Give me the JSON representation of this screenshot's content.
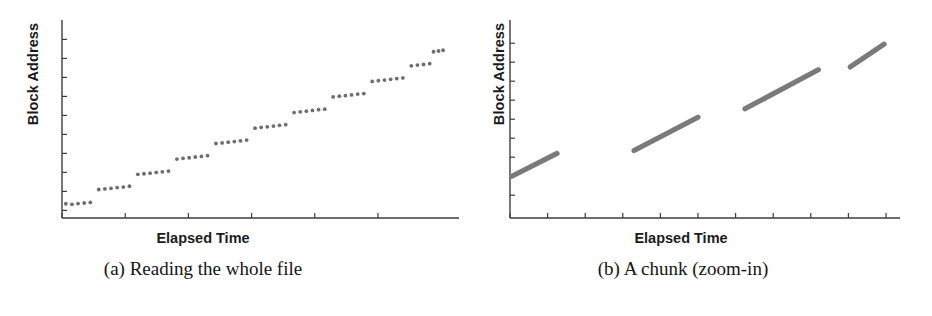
{
  "figure": {
    "panels": [
      {
        "id": "a",
        "ylabel": "Block Address",
        "xlabel": "Elapsed Time",
        "caption": "(a) Reading the whole file"
      },
      {
        "id": "b",
        "ylabel": "Block Address",
        "xlabel": "Elapsed Time",
        "caption": "(b) A chunk (zoom-in)"
      }
    ]
  },
  "chart_data": [
    {
      "type": "scatter",
      "title": "(a) Reading the whole file",
      "xlabel": "Elapsed Time",
      "ylabel": "Block Address",
      "xlim": [
        0,
        100
      ],
      "ylim": [
        0,
        100
      ],
      "grid": false,
      "legend": false,
      "axis_ticks": {
        "x_tick_positions": [
          0,
          16.5,
          33,
          49.5,
          66,
          82.5
        ],
        "y_tick_positions": [
          4,
          14,
          24,
          34,
          44,
          54,
          64,
          74,
          84,
          94
        ]
      },
      "series": [
        {
          "name": "Block Address vs Elapsed Time",
          "description": "Stair-step clusters of dots rising left to right; each cluster is a sequential chunk read",
          "points": [
            [
              1.0,
              7.5
            ],
            [
              2.6,
              7.2
            ],
            [
              4.2,
              7.6
            ],
            [
              5.8,
              7.9
            ],
            [
              7.4,
              8.2
            ],
            [
              9.6,
              15.0
            ],
            [
              11.2,
              15.3
            ],
            [
              12.8,
              15.6
            ],
            [
              14.4,
              16.0
            ],
            [
              16.0,
              16.3
            ],
            [
              17.6,
              16.7
            ],
            [
              19.8,
              23.0
            ],
            [
              21.4,
              23.3
            ],
            [
              23.0,
              23.6
            ],
            [
              24.6,
              24.0
            ],
            [
              26.2,
              24.3
            ],
            [
              27.8,
              24.7
            ],
            [
              30.0,
              31.0
            ],
            [
              31.6,
              31.4
            ],
            [
              33.2,
              31.7
            ],
            [
              34.8,
              32.1
            ],
            [
              36.4,
              32.4
            ],
            [
              38.0,
              32.8
            ],
            [
              40.2,
              39.2
            ],
            [
              41.8,
              39.5
            ],
            [
              43.4,
              39.9
            ],
            [
              45.0,
              40.2
            ],
            [
              46.6,
              40.6
            ],
            [
              48.2,
              41.0
            ],
            [
              50.4,
              47.3
            ],
            [
              52.0,
              47.7
            ],
            [
              53.6,
              48.0
            ],
            [
              55.2,
              48.4
            ],
            [
              56.8,
              48.8
            ],
            [
              58.4,
              49.1
            ],
            [
              60.6,
              55.5
            ],
            [
              62.2,
              55.9
            ],
            [
              63.8,
              56.2
            ],
            [
              65.4,
              56.6
            ],
            [
              67.0,
              57.0
            ],
            [
              68.6,
              57.3
            ],
            [
              70.8,
              63.7
            ],
            [
              72.4,
              64.1
            ],
            [
              74.0,
              64.4
            ],
            [
              75.6,
              64.8
            ],
            [
              77.2,
              65.2
            ],
            [
              78.8,
              65.5
            ],
            [
              81.0,
              71.9
            ],
            [
              82.6,
              72.3
            ],
            [
              84.2,
              72.6
            ],
            [
              85.8,
              73.0
            ],
            [
              87.4,
              73.4
            ],
            [
              89.0,
              73.7
            ],
            [
              91.2,
              80.1
            ],
            [
              92.8,
              80.5
            ],
            [
              94.4,
              80.8
            ],
            [
              96.0,
              81.2
            ],
            [
              97.0,
              87.5
            ],
            [
              98.3,
              87.9
            ],
            [
              99.5,
              88.3
            ]
          ]
        }
      ]
    },
    {
      "type": "line",
      "title": "(b) A chunk (zoom-in)",
      "xlabel": "Elapsed Time",
      "ylabel": "Block Address",
      "xlim": [
        0,
        100
      ],
      "ylim": [
        0,
        100
      ],
      "grid": false,
      "legend": false,
      "axis_ticks": {
        "x_tick_positions": [
          0,
          10,
          20,
          30,
          40,
          50,
          60,
          70,
          80,
          90,
          100
        ],
        "y_tick_positions": [
          12,
          22,
          32,
          42,
          52,
          62,
          72,
          82,
          92
        ]
      },
      "series": [
        {
          "name": "segment-1",
          "description": "First sequential ramp starting at the y-axis",
          "points": [
            [
              0.5,
              22.0
            ],
            [
              12.5,
              34.0
            ]
          ]
        },
        {
          "name": "segment-2",
          "description": "Second sequential ramp after an idle gap",
          "points": [
            [
              33.0,
              35.5
            ],
            [
              50.0,
              53.0
            ]
          ]
        },
        {
          "name": "segment-3",
          "description": "Third sequential ramp after an idle gap",
          "points": [
            [
              62.5,
              57.5
            ],
            [
              82.0,
              78.0
            ]
          ]
        },
        {
          "name": "segment-4",
          "description": "Fourth sequential ramp after an idle gap",
          "points": [
            [
              90.5,
              79.5
            ],
            [
              99.5,
              91.5
            ]
          ]
        }
      ]
    }
  ]
}
